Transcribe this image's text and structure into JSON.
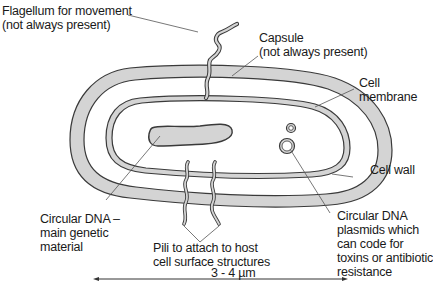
{
  "diagram": {
    "colors": {
      "fill": "#d4d4d4",
      "stroke": "#3a3a3a",
      "leader": "#555555",
      "background": "#ffffff"
    },
    "labels": {
      "flagellum": [
        "Flagellum for movement",
        "(not always present)"
      ],
      "capsule": [
        "Capsule",
        "(not always present)"
      ],
      "cell_membrane": [
        "Cell",
        "membrane"
      ],
      "cell_wall": [
        "Cell wall"
      ],
      "circular_dna": [
        "Circular DNA –",
        "main genetic",
        "material"
      ],
      "pili": [
        "Pili to attach to host",
        "cell surface structures"
      ],
      "plasmids": [
        "Circular DNA",
        "plasmids which",
        "can code for",
        "toxins or antibiotic",
        "resistance"
      ],
      "scale": "3 - 4 µm"
    }
  }
}
